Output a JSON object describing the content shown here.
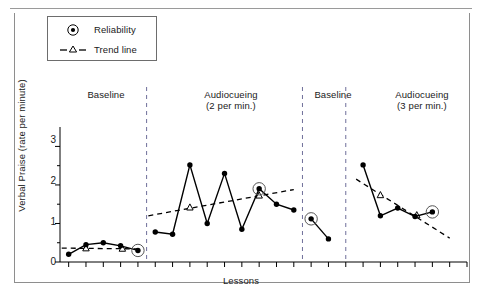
{
  "chart_data": {
    "type": "line",
    "title": "",
    "xlabel": "Lessons",
    "ylabel": "Verbal Praise (rate per minute)",
    "ylim": [
      0,
      3.4
    ],
    "yticks": [
      0,
      1,
      2,
      3
    ],
    "ytick_labels": [
      "0",
      "1",
      "2",
      "3"
    ],
    "minor_yticks": [
      0.5,
      1.5,
      2.5
    ],
    "grid": false,
    "legend_position": "top-left",
    "legend": [
      {
        "label": "Reliability",
        "marker": "circled-dot",
        "line": "none"
      },
      {
        "label": "Trend line",
        "marker": "open-triangle",
        "line": "dashed"
      }
    ],
    "phases": [
      {
        "name": "Baseline",
        "sublabel": "",
        "lessons": [
          1,
          2,
          3,
          4,
          5
        ],
        "values": [
          0.2,
          0.45,
          0.5,
          0.42,
          0.3
        ],
        "reliability_points": [
          5
        ],
        "trend_line": {
          "x": [
            0.6,
            5.2
          ],
          "y": [
            0.36,
            0.34
          ]
        },
        "trend_markers": [
          {
            "x": 2,
            "y": 0.36
          },
          {
            "x": 4.1,
            "y": 0.35
          }
        ]
      },
      {
        "name": "Audiocueing",
        "sublabel": "(2 per min.)",
        "lessons": [
          6,
          7,
          8,
          9,
          10,
          11,
          12,
          13,
          14
        ],
        "values": [
          0.78,
          0.72,
          2.52,
          1.0,
          2.3,
          0.85,
          1.9,
          1.5,
          1.35
        ],
        "reliability_points": [
          12
        ],
        "trend_line": {
          "x": [
            5.6,
            14.0
          ],
          "y": [
            1.2,
            1.88
          ]
        },
        "trend_markers": [
          {
            "x": 8.0,
            "y": 1.42
          },
          {
            "x": 12.0,
            "y": 1.73
          }
        ]
      },
      {
        "name": "Baseline",
        "sublabel": "",
        "lessons": [
          15,
          16
        ],
        "values": [
          1.12,
          0.6
        ],
        "reliability_points": [
          15
        ],
        "trend_line": null,
        "trend_markers": []
      },
      {
        "name": "Audiocueing",
        "sublabel": "(3 per min.)",
        "lessons": [
          18,
          19,
          20,
          21,
          22
        ],
        "values": [
          2.52,
          1.2,
          1.4,
          1.18,
          1.3
        ],
        "reliability_points": [
          22
        ],
        "trend_line": {
          "x": [
            17.6,
            23.0
          ],
          "y": [
            2.15,
            0.62
          ]
        },
        "trend_markers": [
          {
            "x": 19.0,
            "y": 1.74
          },
          {
            "x": 21.1,
            "y": 1.22
          }
        ]
      }
    ],
    "phase_divider_lessons": [
      5.5,
      14.5,
      17.0
    ],
    "series_style": {
      "data_line": "solid-black",
      "data_marker": "filled-circle",
      "trend_style": "dashed-black"
    }
  },
  "axis": {
    "y_label": "Verbal Praise (rate per minute)",
    "x_label": "Lessons",
    "y_tick_0": "0",
    "y_tick_1": "1",
    "y_tick_2": "2",
    "y_tick_3": "3"
  },
  "legend": {
    "reliability_label": "Reliability",
    "trend_label": "Trend line"
  },
  "phase_labels": {
    "p1_title": "Baseline",
    "p2_title": "Audiocueing",
    "p2_sub": "(2 per min.)",
    "p3_title": "Baseline",
    "p4_title": "Audiocueing",
    "p4_sub": "(3 per min.)"
  },
  "colors": {
    "ink": "#000000",
    "frame": "#8e8e8e",
    "divider": "#6f6f9a"
  }
}
